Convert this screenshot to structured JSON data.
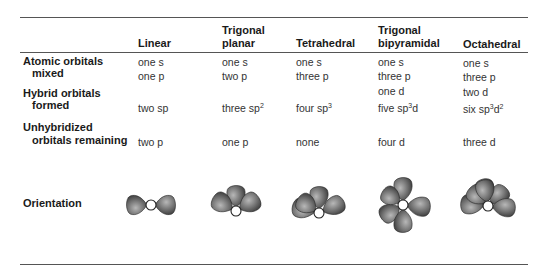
{
  "table": {
    "columns": [
      {
        "label": "Linear"
      },
      {
        "label_line1": "Trigonal",
        "label_line2": "planar"
      },
      {
        "label": "Tetrahedral"
      },
      {
        "label_line1": "Trigonal",
        "label_line2": "bipyramidal"
      },
      {
        "label": "Octahedral"
      }
    ],
    "rows": {
      "atomic_orbitals_mixed": {
        "label_line1": "Atomic orbitals",
        "label_line2": "mixed",
        "values": [
          [
            "one s",
            "one p"
          ],
          [
            "one s",
            "two p"
          ],
          [
            "one s",
            "three p"
          ],
          [
            "one s",
            "three p",
            "one d"
          ],
          [
            "one s",
            "three p",
            "two d"
          ]
        ]
      },
      "hybrid_orbitals_formed": {
        "label_line1": "Hybrid orbitals",
        "label_line2": "formed",
        "values": [
          {
            "count": "two",
            "base": "sp",
            "sup1": "",
            "mid": "",
            "sup2": ""
          },
          {
            "count": "three",
            "base": "sp",
            "sup1": "2",
            "mid": "",
            "sup2": ""
          },
          {
            "count": "four",
            "base": "sp",
            "sup1": "3",
            "mid": "",
            "sup2": ""
          },
          {
            "count": "five",
            "base": "sp",
            "sup1": "3",
            "mid": "d",
            "sup2": ""
          },
          {
            "count": "six",
            "base": "sp",
            "sup1": "3",
            "mid": "d",
            "sup2": "2"
          }
        ]
      },
      "unhybridized_orbitals_remaining": {
        "label_line1": "Unhybridized",
        "label_line2": "orbitals remaining",
        "values": [
          "two p",
          "one p",
          "none",
          "four d",
          "three d"
        ]
      },
      "orientation": {
        "label": "Orientation",
        "shapes": [
          "linear",
          "trigonal-planar",
          "tetrahedral",
          "trigonal-bipyramidal",
          "octahedral"
        ]
      }
    }
  },
  "colors": {
    "lobe_dark": "#3a3a3a",
    "lobe_light": "#b8b8b8",
    "rule": "#555555"
  }
}
